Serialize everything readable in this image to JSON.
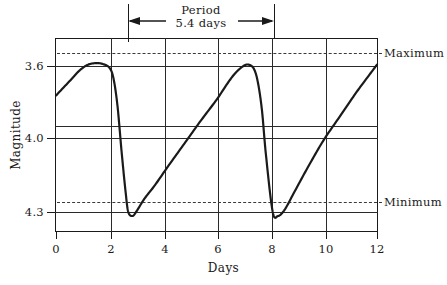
{
  "chart_data": {
    "type": "line",
    "title": "",
    "xlabel": "Days",
    "ylabel": "Magnitude",
    "xlim": [
      0,
      12
    ],
    "ylim": [
      4.38,
      3.47
    ],
    "y_inverted": true,
    "grid": true,
    "legend": "none",
    "xticks": [
      "0",
      "2",
      "4",
      "6",
      "8",
      "10",
      "12"
    ],
    "xtick_values": [
      0,
      2,
      4,
      6,
      8,
      10,
      12
    ],
    "yticks": [
      "3.6",
      "4.0",
      "4.3"
    ],
    "ytick_values": [
      3.6,
      4.0,
      4.3
    ],
    "gridline_y_values": [
      3.6,
      3.93,
      4.0,
      4.3
    ],
    "annotations": {
      "maximum_label": "Maximum",
      "maximum_value": 3.53,
      "minimum_label": "Minimum",
      "minimum_value": 4.26,
      "period_label": "Period",
      "period_value_label": "5.4 days",
      "period_days": 5.4,
      "period_span": [
        2.7,
        8.1
      ]
    },
    "series": [
      {
        "name": "light-curve",
        "x": [
          0.0,
          0.3,
          0.6,
          0.9,
          1.2,
          1.5,
          1.75,
          2.0,
          2.15,
          2.3,
          2.45,
          2.6,
          2.7,
          2.85,
          3.0,
          3.3,
          3.7,
          4.2,
          4.8,
          5.4,
          6.0,
          6.4,
          6.7,
          7.0,
          7.2,
          7.4,
          7.55,
          7.7,
          7.85,
          8.1,
          8.3,
          8.55,
          8.9,
          9.4,
          10.0,
          10.6,
          11.2,
          11.7,
          12.0
        ],
        "y": [
          4.11,
          4.15,
          4.19,
          4.23,
          4.255,
          4.262,
          4.258,
          4.24,
          4.19,
          4.06,
          3.85,
          3.66,
          3.565,
          3.545,
          3.565,
          3.625,
          3.69,
          3.78,
          3.885,
          3.99,
          4.09,
          4.165,
          4.215,
          4.248,
          4.255,
          4.235,
          4.17,
          4.04,
          3.83,
          3.565,
          3.545,
          3.575,
          3.655,
          3.77,
          3.9,
          4.01,
          4.12,
          4.205,
          4.255
        ]
      }
    ]
  },
  "axis_title_x": "Days",
  "axis_title_y": "Magnitude",
  "right_labels": {
    "maximum": "Maximum",
    "minimum": "Minimum"
  },
  "period_annotation": {
    "line1": "Period",
    "line2": "5.4 days"
  },
  "tick_labels": {
    "x": [
      "0",
      "2",
      "4",
      "6",
      "8",
      "10",
      "12"
    ],
    "y": [
      "3.6",
      "4.0",
      "4.3"
    ]
  },
  "colors": {
    "ink": "#1a1a1a",
    "grid": "#2a2a2a",
    "dash": "#3a3a3a"
  }
}
